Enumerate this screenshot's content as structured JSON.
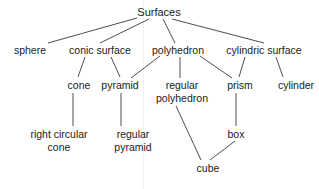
{
  "diagram": {
    "root": "Surfaces",
    "nodes": [
      {
        "id": "surfaces",
        "lines": [
          "Surfaces"
        ],
        "x": 159,
        "y": 12
      },
      {
        "id": "sphere",
        "lines": [
          "sphere"
        ],
        "x": 30,
        "y": 50
      },
      {
        "id": "conic-surface",
        "lines": [
          "conic surface"
        ],
        "x": 100,
        "y": 50
      },
      {
        "id": "polyhedron",
        "lines": [
          "polyhedron"
        ],
        "x": 178,
        "y": 50
      },
      {
        "id": "cylindric-surface",
        "lines": [
          "cylindric surface"
        ],
        "x": 264,
        "y": 50
      },
      {
        "id": "cone",
        "lines": [
          "cone"
        ],
        "x": 79,
        "y": 85
      },
      {
        "id": "pyramid",
        "lines": [
          "pyramid"
        ],
        "x": 120,
        "y": 85
      },
      {
        "id": "regular-polyhedron",
        "lines": [
          "regular",
          "polyhedron"
        ],
        "x": 182,
        "y": 92
      },
      {
        "id": "prism",
        "lines": [
          "prism"
        ],
        "x": 240,
        "y": 85
      },
      {
        "id": "cylinder",
        "lines": [
          "cylinder"
        ],
        "x": 296,
        "y": 85
      },
      {
        "id": "right-circular-cone",
        "lines": [
          "right circular",
          "cone"
        ],
        "x": 59,
        "y": 141
      },
      {
        "id": "regular-pyramid",
        "lines": [
          "regular",
          "pyramid"
        ],
        "x": 133,
        "y": 141
      },
      {
        "id": "box",
        "lines": [
          "box"
        ],
        "x": 236,
        "y": 134
      },
      {
        "id": "cube",
        "lines": [
          "cube"
        ],
        "x": 208,
        "y": 168
      }
    ],
    "edges": [
      {
        "from": "surfaces",
        "to": "sphere",
        "x1": 137,
        "y1": 18,
        "x2": 48,
        "y2": 43
      },
      {
        "from": "surfaces",
        "to": "conic-surface",
        "x1": 149,
        "y1": 19,
        "x2": 100,
        "y2": 43
      },
      {
        "from": "surfaces",
        "to": "polyhedron",
        "x1": 163,
        "y1": 19,
        "x2": 175,
        "y2": 43
      },
      {
        "from": "surfaces",
        "to": "cylindric-surface",
        "x1": 172,
        "y1": 19,
        "x2": 264,
        "y2": 43
      },
      {
        "from": "conic-surface",
        "to": "cone",
        "x1": 85,
        "y1": 57,
        "x2": 78,
        "y2": 77
      },
      {
        "from": "conic-surface",
        "to": "pyramid",
        "x1": 111,
        "y1": 57,
        "x2": 120,
        "y2": 77
      },
      {
        "from": "polyhedron",
        "to": "pyramid",
        "x1": 160,
        "y1": 56,
        "x2": 131,
        "y2": 78
      },
      {
        "from": "polyhedron",
        "to": "regular-polyhedron",
        "x1": 180,
        "y1": 57,
        "x2": 180,
        "y2": 78
      },
      {
        "from": "polyhedron",
        "to": "prism",
        "x1": 200,
        "y1": 56,
        "x2": 232,
        "y2": 78
      },
      {
        "from": "cylindric-surface",
        "to": "prism",
        "x1": 245,
        "y1": 57,
        "x2": 239,
        "y2": 77
      },
      {
        "from": "cylindric-surface",
        "to": "cylinder",
        "x1": 276,
        "y1": 57,
        "x2": 283,
        "y2": 77
      },
      {
        "from": "cone",
        "to": "right-circular-cone",
        "x1": 73,
        "y1": 93,
        "x2": 73,
        "y2": 126
      },
      {
        "from": "pyramid",
        "to": "regular-pyramid",
        "x1": 121,
        "y1": 93,
        "x2": 121,
        "y2": 126
      },
      {
        "from": "regular-polyhedron",
        "to": "cube",
        "x1": 176,
        "y1": 106,
        "x2": 201,
        "y2": 160
      },
      {
        "from": "prism",
        "to": "box",
        "x1": 236,
        "y1": 93,
        "x2": 236,
        "y2": 126
      },
      {
        "from": "box",
        "to": "cube",
        "x1": 235,
        "y1": 141,
        "x2": 210,
        "y2": 160
      }
    ]
  }
}
